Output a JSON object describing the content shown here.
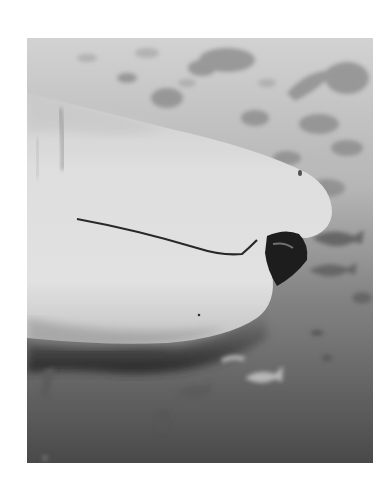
{
  "image": {
    "subject": "shark-head-closeup-underwater",
    "colors": {
      "page_background": "#ffffff",
      "water_top": "#d6d6d6",
      "water_mid": "#8e8e8e",
      "water_bottom": "#4a4a4a",
      "shark_skin_light": "#e8e8e8",
      "shark_skin_shadow": "#b8b8b8",
      "shark_belly_dark": "#2e2e2e",
      "mouth_dark": "#1e1e1e",
      "fish_dark": "#6a6a6a",
      "fish_light": "#bdbdbd"
    }
  }
}
